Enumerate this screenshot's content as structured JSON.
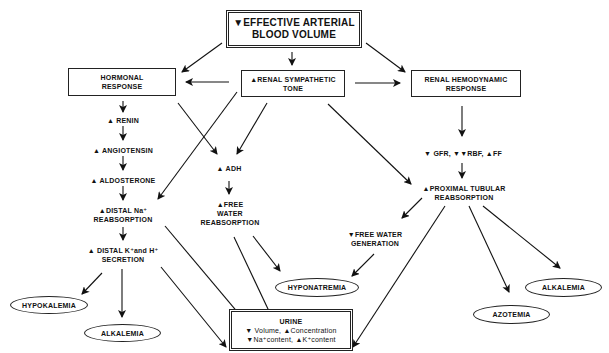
{
  "symbols": {
    "up": "▲",
    "down": "▼"
  },
  "nodes": {
    "top": {
      "line1": "▼EFFECTIVE ARTERIAL",
      "line2": "BLOOD VOLUME"
    },
    "hormonal": {
      "line1": "HORMONAL",
      "line2": "RESPONSE"
    },
    "sympathetic": {
      "line1": "▲RENAL SYMPATHETIC",
      "line2": "TONE"
    },
    "hemodynamic": {
      "line1": "RENAL HEMODYNAMIC",
      "line2": "RESPONSE"
    },
    "renin": "▲ RENIN",
    "angiotensin": "▲ ANGIOTENSIN",
    "aldosterone": "▲ ALDOSTERONE",
    "distal_na": {
      "line1": "▲DISTAL Na⁺",
      "line2": "REABSORPTION"
    },
    "distal_kh": {
      "line1": "▲ DISTAL K⁺and H⁺",
      "line2": "SECRETION"
    },
    "adh": "▲ ADH",
    "free_water_reabs": {
      "line1": "▲FREE",
      "line2": "WATER",
      "line3": "REABSORPTION"
    },
    "gfr": "▼ GFR, ▼▼RBF, ▲FF",
    "proximal": {
      "line1": "▲PROXIMAL TUBULAR",
      "line2": "REABSORPTION"
    },
    "free_water_gen": {
      "line1": "▼FREE WATER",
      "line2": "GENERATION"
    },
    "hypokalemia": "HYPOKALEMIA",
    "alkalemia_left": "ALKALEMIA",
    "hyponatremia": "HYPONATREMIA",
    "azotemia": "AZOTEMIA",
    "alkalemia_right": "ALKALEMIA",
    "urine": {
      "title": "URINE",
      "line1": "▼ Volume, ▲Concentration",
      "line2": "▼Na⁺content, ▲K⁺content"
    }
  },
  "colors": {
    "ink": "#111111",
    "background": "#ffffff"
  }
}
